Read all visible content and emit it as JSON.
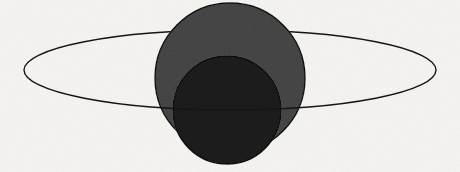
{
  "figure": {
    "kind": "line-and-fill diagram",
    "background_color": "#f6f5f2",
    "ink_color": "#141414"
  },
  "shapes": {
    "ring_ellipse": {
      "name": "ring-ellipse",
      "cx": 230,
      "cy": 70,
      "rx": 206,
      "ry": 40,
      "fill": "none",
      "stroke": "#151515",
      "stroke_width": 1.4,
      "left_extent_x": 24,
      "right_extent_x": 436,
      "top_extent_y": 30,
      "bottom_extent_y": 110
    },
    "outer_sphere": {
      "name": "outer-sphere",
      "cx": 230,
      "cy": 78,
      "r": 75,
      "fill": "#4b4b4b",
      "stroke": "#101010",
      "stroke_width": 1.4,
      "top_y": 3,
      "bottom_y": 153,
      "left_x": 155,
      "right_x": 305
    },
    "inner_sphere": {
      "name": "inner-sphere",
      "cx": 227,
      "cy": 110,
      "r": 54,
      "fill": "#1f1f1f",
      "stroke": "#0a0a0a",
      "stroke_width": 1.4,
      "top_y": 56,
      "bottom_y": 164,
      "left_x": 173,
      "right_x": 281
    }
  },
  "layers": [
    {
      "name": "ring-behind-arc",
      "order": 1,
      "description": "upper half of ring drawn behind the spheres"
    },
    {
      "name": "outer-sphere",
      "order": 2,
      "description": "large mid-gray filled disc"
    },
    {
      "name": "inner-sphere",
      "order": 3,
      "description": "smaller near-black filled disc, offset low"
    },
    {
      "name": "ring-front-arc",
      "order": 4,
      "description": "lower half of ring drawn in front of the spheres"
    }
  ],
  "labels": {
    "caption": "",
    "annotations": []
  }
}
